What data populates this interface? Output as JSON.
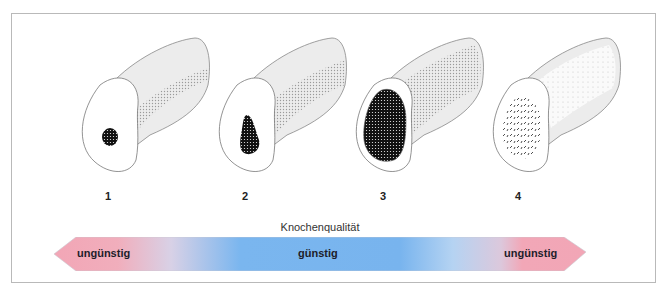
{
  "figure": {
    "bones": [
      {
        "number": "1",
        "label_left": 105,
        "left": 70
      },
      {
        "number": "2",
        "label_left": 242,
        "left": 207
      },
      {
        "number": "3",
        "label_left": 380,
        "left": 344
      },
      {
        "number": "4",
        "label_left": 515,
        "left": 481
      }
    ],
    "axis_label": "Knochenqualität",
    "scale": {
      "left_label": "ungünstig",
      "center_label": "günstig",
      "right_label": "ungünstig",
      "colors": {
        "unfavorable": "#f3a9b8",
        "favorable": "#78b6ef",
        "transition": "#d2d2e6"
      }
    }
  }
}
